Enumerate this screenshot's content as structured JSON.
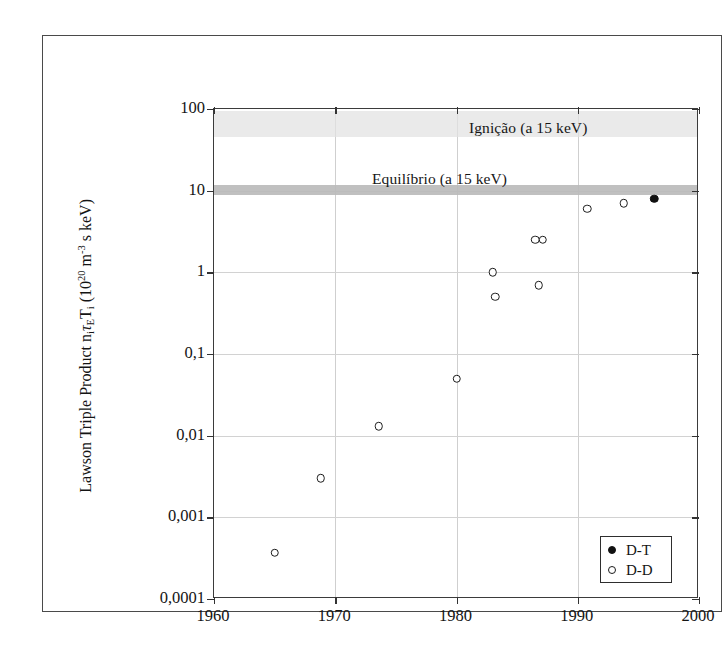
{
  "figure": {
    "y_axis_title_parts": {
      "prefix": "Lawson Triple Product n",
      "sub1": "i",
      "tau": "τ",
      "sub2": "E",
      "t": "T",
      "sub3": "i",
      "units_open": " (10",
      "exp1": "20",
      "units_mid": " m",
      "exp2": "-3",
      "units_close": " s keV)"
    },
    "annotations": [
      {
        "name": "ignition",
        "text": "Ignição (a 15 keV)",
        "value": 65
      },
      {
        "name": "equilibrium",
        "text": "Equilíbrio (a 15 keV)",
        "value": 10
      }
    ],
    "legend": {
      "entries": [
        {
          "label": "D-T",
          "marker": "filled"
        },
        {
          "label": "D-D",
          "marker": "open"
        }
      ]
    }
  },
  "chart_data": {
    "type": "scatter",
    "title": "",
    "xlabel": "",
    "ylabel": "Lawson Triple Product n_i τ_E T_i (10^20 m^-3 s keV)",
    "xlim": [
      1960,
      2000
    ],
    "ylim": [
      0.0001,
      100
    ],
    "yscale": "log",
    "xscale": "linear",
    "grid": true,
    "legend_position": "bottom-right",
    "xticks": [
      1960,
      1970,
      1980,
      1990,
      2000
    ],
    "xticklabels": [
      "1960",
      "1970",
      "1980",
      "1990",
      "2000"
    ],
    "yticks": [
      0.0001,
      0.001,
      0.01,
      0.1,
      1,
      10,
      100
    ],
    "yticklabels": [
      "0,0001",
      "0,001",
      "0,01",
      "0,1",
      "1",
      "10",
      "100"
    ],
    "series": [
      {
        "name": "D-D",
        "marker": "open-circle",
        "color": "#1c1c1c",
        "points": [
          {
            "x": 1965.0,
            "y": 0.00037
          },
          {
            "x": 1968.8,
            "y": 0.003
          },
          {
            "x": 1973.6,
            "y": 0.013
          },
          {
            "x": 1980.0,
            "y": 0.05
          },
          {
            "x": 1983.0,
            "y": 1.0
          },
          {
            "x": 1983.2,
            "y": 0.5
          },
          {
            "x": 1986.8,
            "y": 0.7
          },
          {
            "x": 1986.5,
            "y": 2.5
          },
          {
            "x": 1987.1,
            "y": 2.5
          },
          {
            "x": 1990.8,
            "y": 6.0
          },
          {
            "x": 1993.8,
            "y": 7.0
          }
        ]
      },
      {
        "name": "D-T",
        "marker": "filled-circle",
        "color": "#111111",
        "points": [
          {
            "x": 1996.3,
            "y": 8.0
          }
        ]
      }
    ],
    "bands": [
      {
        "name": "Ignição (a 15 keV)",
        "y_low": 45,
        "y_high": 95,
        "color": "#e2e2e2"
      },
      {
        "name": "Equilíbrio (a 15 keV)",
        "y_low": 8.8,
        "y_high": 11.6,
        "color": "#b9b9b9"
      }
    ]
  }
}
